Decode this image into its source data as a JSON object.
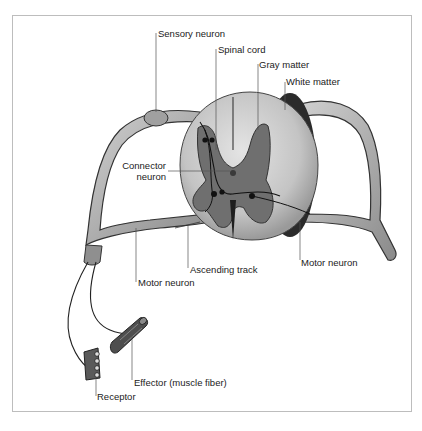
{
  "figure": {
    "labels": {
      "sensory_neuron": "Sensory neuron",
      "spinal_cord": "Spinal cord",
      "gray_matter": "Gray matter",
      "white_matter": "White matter",
      "connector_neuron_line1": "Connector",
      "connector_neuron_line2": "neuron",
      "motor_neuron_right": "Motor neuron",
      "ascending_track": "Ascending track",
      "motor_neuron_left": "Motor neuron",
      "effector": "Effector (muscle fiber)",
      "receptor": "Receptor"
    },
    "colors": {
      "ink": "#222222",
      "white_matter": "#c9c9c9",
      "gray_matter": "#7a7a7a",
      "nerve": "#9a9a9a",
      "frame": "#bdbdbd"
    }
  }
}
